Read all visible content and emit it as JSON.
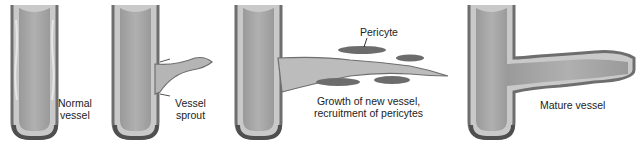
{
  "diagram": {
    "type": "process-sequence",
    "topic": "Angiogenesis stages",
    "panels": [
      {
        "id": "normal",
        "label_line1": "Normal",
        "label_line2": "vessel"
      },
      {
        "id": "sprout",
        "label_line1": "Vessel",
        "label_line2": "sprout"
      },
      {
        "id": "growth",
        "label_line1": "Growth of new vessel,",
        "label_line2": "recruitment of pericytes",
        "callout": "Pericyte"
      },
      {
        "id": "mature",
        "label_line1": "Mature vessel"
      }
    ],
    "colors": {
      "wall": "#7d7d7d",
      "lumen": "#a3a3a3",
      "endothelium": "#d6d6d6",
      "basement": "#5a5a5a",
      "pericyte": "#707070"
    }
  }
}
